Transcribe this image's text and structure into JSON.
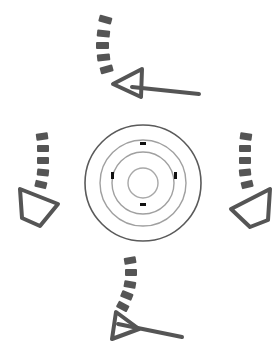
{
  "diagram": {
    "type": "directional-arrows-around-target",
    "colors": {
      "background": "#ffffff",
      "arrow": "#555555",
      "outer_ring": "#555555",
      "inner_rings": "#9a9a9a",
      "tick": "#111111"
    },
    "target": {
      "center": [
        143,
        183
      ],
      "rings": [
        {
          "r": 58,
          "color": "#5a5a5a",
          "width": 1.6
        },
        {
          "r": 43,
          "color": "#a0a0a0",
          "width": 1.4
        },
        {
          "r": 31,
          "color": "#a0a0a0",
          "width": 1.4
        },
        {
          "r": 15,
          "color": "#a8a8a8",
          "width": 1.4
        }
      ],
      "ticks": [
        "top",
        "bottom",
        "left",
        "right"
      ]
    },
    "arrows": [
      {
        "name": "top",
        "direction": "curved-left",
        "label": ""
      },
      {
        "name": "left",
        "direction": "curved-down",
        "label": ""
      },
      {
        "name": "right",
        "direction": "curved-down",
        "label": ""
      },
      {
        "name": "bottom",
        "direction": "curved-left",
        "label": ""
      }
    ]
  }
}
